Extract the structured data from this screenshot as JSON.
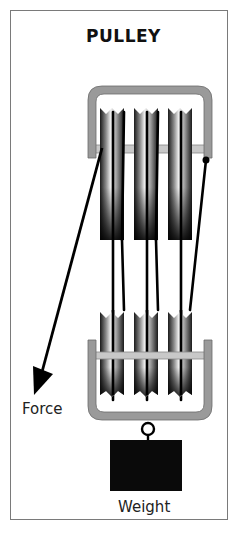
{
  "figure": {
    "title": "PULLEY",
    "labels": {
      "force": "Force",
      "weight": "Weight"
    },
    "clipped_caption": "",
    "colors": {
      "frame_border": "#7a7a7a",
      "bracket": "#9a9a9a",
      "rope": "#000000",
      "weight": "#0a0a0a",
      "sheave_dark": "#111111",
      "sheave_light": "#f0f0f0"
    },
    "components": {
      "top_block_sheaves": 3,
      "bottom_block_sheaves": 3,
      "rope_segments": 6
    }
  }
}
